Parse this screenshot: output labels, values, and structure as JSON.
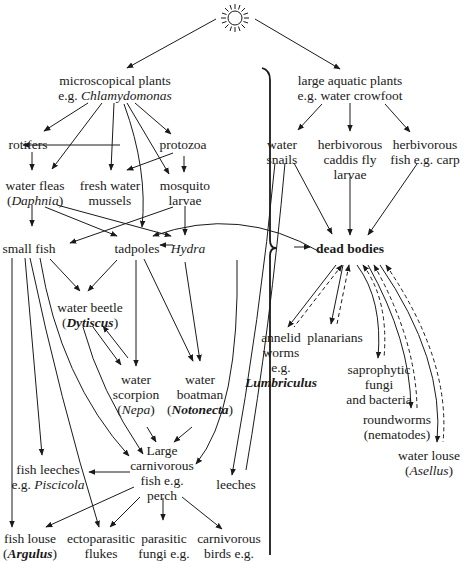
{
  "diagram": {
    "type": "food web",
    "source": "sun",
    "nodes": {
      "sun": {
        "label": "sun-icon"
      },
      "micro_plants": {
        "line1": "microscopical plants",
        "line2_prefix": "e.g. ",
        "line2_italic": "Chlamydomonas"
      },
      "large_plants": {
        "line1": "large aquatic plants",
        "line2": "e.g. water crowfoot"
      },
      "rotifers": {
        "line1": "rotifers"
      },
      "protozoa": {
        "line1": "protozoa"
      },
      "water_fleas": {
        "line1": "water fleas",
        "line2_italic": "Daphnia"
      },
      "mussels": {
        "line1": "fresh water",
        "line2": "mussels"
      },
      "mosquito": {
        "line1": "mosquito",
        "line2": "larvae"
      },
      "water_snails": {
        "line1": "water",
        "line2": "snails"
      },
      "caddis": {
        "line1": "herbivorous",
        "line2": "caddis fly",
        "line3": "larvae"
      },
      "herb_fish": {
        "line1": "herbivorous",
        "line2": "fish e.g. carp"
      },
      "small_fish": {
        "line1": "small fish"
      },
      "tadpoles": {
        "line1": "tadpoles"
      },
      "hydra": {
        "line1_italic": "Hydra"
      },
      "dead_bodies": {
        "line1": "dead bodies"
      },
      "water_beetle": {
        "line1": "water beetle",
        "line2_italic": "Dytiscus"
      },
      "water_scorpion": {
        "line1": "water",
        "line2": "scorpion",
        "line3_italic": "Nepa"
      },
      "water_boatman": {
        "line1": "water",
        "line2": "boatman",
        "line3_italic": "Notonecta"
      },
      "annelid": {
        "line1": "annelid",
        "line2": "worms",
        "line3": "e.g.",
        "line4_italic": "Lumbriculus"
      },
      "planarians": {
        "line1": "planarians"
      },
      "saprophytic": {
        "line1": "saprophytic",
        "line2": "fungi",
        "line3": "and bacteria"
      },
      "roundworms": {
        "line1": "roundworms",
        "line2": "(nematodes)"
      },
      "water_louse": {
        "line1": "water louse",
        "line2_italic": "Asellus"
      },
      "large_fish": {
        "line1": "Large",
        "line2": "carnivorous",
        "line3": "fish e.g.",
        "line4": "perch"
      },
      "fish_leeches": {
        "line1": "fish leeches",
        "line2_prefix": "e.g. ",
        "line2_italic": "Piscicola"
      },
      "leeches": {
        "line1": "leeches"
      },
      "fish_louse": {
        "line1": "fish louse",
        "line2_italic": "Argulus"
      },
      "flukes": {
        "line1": "ectoparasitic",
        "line2": "flukes"
      },
      "parasitic_fungi": {
        "line1": "parasitic",
        "line2": "fungi e.g."
      },
      "carn_birds": {
        "line1": "carnivorous",
        "line2": "birds e.g."
      }
    },
    "colors": {
      "ink": "#1a1a1a",
      "background": "#ffffff"
    }
  }
}
